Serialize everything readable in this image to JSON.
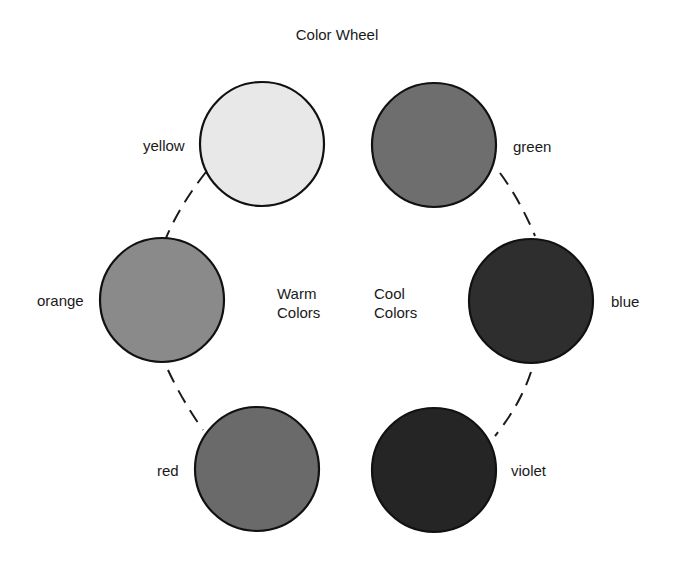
{
  "title": "Color Wheel",
  "groups": {
    "warm": {
      "line1": "Warm",
      "line2": "Colors"
    },
    "cool": {
      "line1": "Cool",
      "line2": "Colors"
    }
  },
  "colors": [
    {
      "name": "yellow",
      "fill": "#e8e8e8",
      "group": "warm"
    },
    {
      "name": "green",
      "fill": "#6e6e6e",
      "group": "cool"
    },
    {
      "name": "orange",
      "fill": "#8a8a8a",
      "group": "warm"
    },
    {
      "name": "blue",
      "fill": "#2e2e2e",
      "group": "cool"
    },
    {
      "name": "red",
      "fill": "#6a6a6a",
      "group": "warm"
    },
    {
      "name": "violet",
      "fill": "#252525",
      "group": "cool"
    }
  ],
  "connectors": {
    "style": "dashed",
    "color": "#1a1a1a"
  }
}
